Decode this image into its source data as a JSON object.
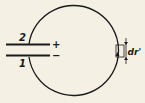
{
  "diagram": {
    "plate_top_label": "2",
    "plate_bottom_label": "1",
    "plus_sign": "+",
    "minus_sign": "−",
    "element_label": "dr'",
    "colors": {
      "ink": "#1a1a1a",
      "background": "#f4f1e4"
    }
  }
}
